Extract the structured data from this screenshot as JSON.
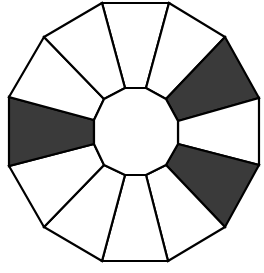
{
  "diagram": {
    "type": "segmented-dodecagon-ring",
    "colors": {
      "shaded": "#3a3a3a",
      "unshaded": "#ffffff",
      "stroke": "#000000"
    },
    "outer_vertices": [
      [
        102,
        3
      ],
      [
        169,
        3
      ],
      [
        225,
        37
      ],
      [
        259,
        98
      ],
      [
        259,
        165
      ],
      [
        225,
        227
      ],
      [
        168,
        261
      ],
      [
        102,
        261
      ],
      [
        44,
        227
      ],
      [
        9,
        166
      ],
      [
        9,
        97
      ],
      [
        44,
        37
      ]
    ],
    "inner_vertices": [
      [
        125,
        88
      ],
      [
        146,
        88
      ],
      [
        166,
        99
      ],
      [
        178,
        121
      ],
      [
        178,
        144
      ],
      [
        166,
        165
      ],
      [
        146,
        175
      ],
      [
        125,
        175
      ],
      [
        104,
        165
      ],
      [
        94,
        144
      ],
      [
        94,
        120
      ],
      [
        104,
        99
      ]
    ],
    "segments": [
      {
        "id": "top",
        "shaded": false
      },
      {
        "id": "upper-right-1",
        "shaded": false
      },
      {
        "id": "upper-right-2",
        "shaded": true
      },
      {
        "id": "right",
        "shaded": false
      },
      {
        "id": "lower-right-2",
        "shaded": true
      },
      {
        "id": "lower-right-1",
        "shaded": false
      },
      {
        "id": "bottom",
        "shaded": false
      },
      {
        "id": "lower-left-1",
        "shaded": false
      },
      {
        "id": "lower-left-2",
        "shaded": false
      },
      {
        "id": "left",
        "shaded": true
      },
      {
        "id": "upper-left-2",
        "shaded": false
      },
      {
        "id": "upper-left-1",
        "shaded": false
      }
    ],
    "shaded_count": 3,
    "total_segments": 12
  }
}
